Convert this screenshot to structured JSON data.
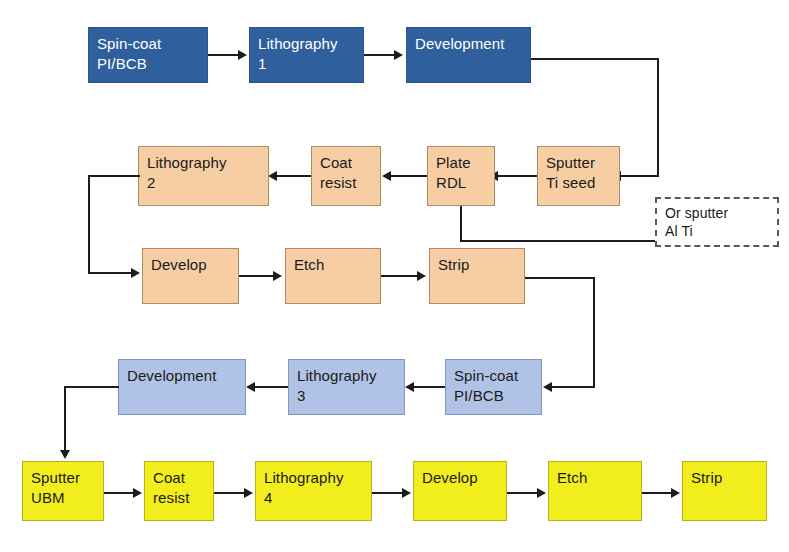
{
  "diagram": {
    "palette": {
      "dark_blue": "#2f609d",
      "peach": "#f7cda3",
      "light_blue": "#b0c3e6",
      "yellow": "#f2ed1c",
      "connector": "#1c1c1c",
      "dashed_border": "#595959",
      "box_border": "#7f7f7f",
      "background": "#ffffff"
    },
    "rows": [
      {
        "name": "row-1-passivation",
        "color_key": "dark_blue",
        "direction": "left-to-right",
        "nodes": [
          {
            "id": "spin-coat-1",
            "label": "Spin-coat\nPI/BCB"
          },
          {
            "id": "lithography-1",
            "label": "Lithography\n1"
          },
          {
            "id": "development-1",
            "label": "Development"
          }
        ]
      },
      {
        "name": "row-2-seed-and-plate",
        "color_key": "peach",
        "direction": "right-to-left",
        "nodes": [
          {
            "id": "sputter-ti-seed",
            "label": "Sputter\nTi seed"
          },
          {
            "id": "plate-rdl",
            "label": "Plate\nRDL"
          },
          {
            "id": "coat-resist-2",
            "label": "Coat\nresist"
          },
          {
            "id": "lithography-2",
            "label": "Lithography\n2"
          }
        ]
      },
      {
        "name": "row-3-rdl-pattern",
        "color_key": "peach",
        "direction": "left-to-right",
        "nodes": [
          {
            "id": "develop-3",
            "label": "Develop"
          },
          {
            "id": "etch-3",
            "label": "Etch"
          },
          {
            "id": "strip-3",
            "label": "Strip"
          }
        ]
      },
      {
        "name": "row-4-second-dielectric",
        "color_key": "light_blue",
        "direction": "right-to-left",
        "nodes": [
          {
            "id": "spin-coat-2",
            "label": "Spin-coat\nPI/BCB"
          },
          {
            "id": "lithography-3",
            "label": "Lithography\n3"
          },
          {
            "id": "development-2",
            "label": "Development"
          }
        ]
      },
      {
        "name": "row-5-ubm",
        "color_key": "yellow",
        "direction": "left-to-right",
        "nodes": [
          {
            "id": "sputter-ubm",
            "label": "Sputter\nUBM"
          },
          {
            "id": "coat-resist-5",
            "label": "Coat\nresist"
          },
          {
            "id": "lithography-4",
            "label": "Lithography\n4"
          },
          {
            "id": "develop-5",
            "label": "Develop"
          },
          {
            "id": "etch-5",
            "label": "Etch"
          },
          {
            "id": "strip-5",
            "label": "Strip"
          }
        ]
      }
    ],
    "annotation": {
      "id": "or-sputter-al-ti",
      "label": "Or sputter\nAl Ti",
      "style": "dashed",
      "attached_to": "plate-rdl"
    },
    "caption": ""
  }
}
